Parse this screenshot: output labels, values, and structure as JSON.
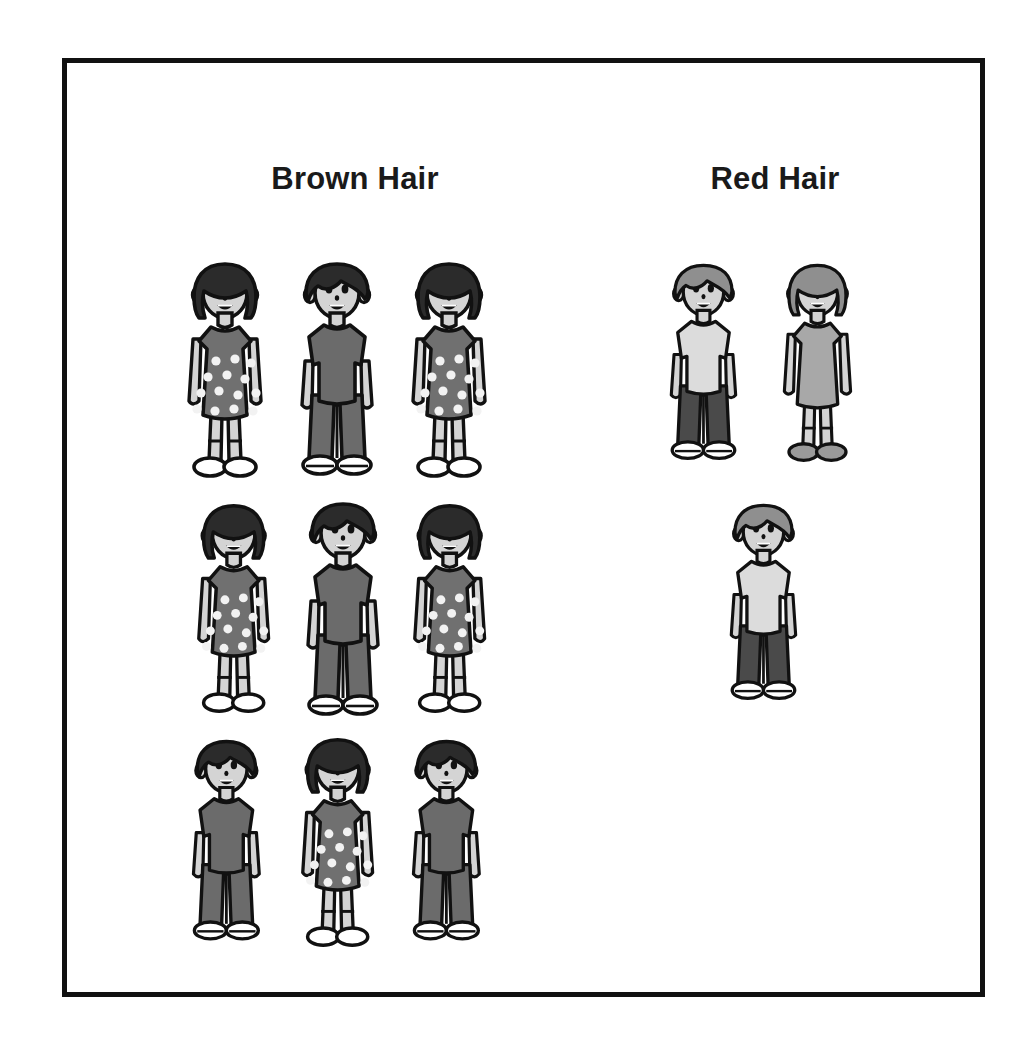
{
  "page": {
    "background": "#ffffff",
    "frame_border_color": "#111111"
  },
  "palette": {
    "outline": "#111111",
    "skin": "#d4d4d4",
    "hair_brown": "#2b2b2b",
    "hair_red": "#8f8f8f",
    "shirt_dark": "#6b6b6b",
    "shirt_light": "#dcdcdc",
    "dress_dark": "#707070",
    "dress_light": "#a8a8a8",
    "pants_dark": "#4a4a4a",
    "shoe_white": "#ffffff",
    "shoe_gray": "#9a9a9a",
    "dot_white": "#f2f2f2"
  },
  "columns": [
    {
      "id": "brown",
      "title": "Brown Hair",
      "count": 9
    },
    {
      "id": "red",
      "title": "Red Hair",
      "count": 3
    }
  ],
  "chart_data": {
    "type": "bar",
    "title": "",
    "subtitle": "",
    "xlabel": "",
    "ylabel": "",
    "categories": [
      "Brown Hair",
      "Red Hair"
    ],
    "values": [
      9,
      3
    ],
    "ylim": [
      0,
      9
    ],
    "grid": false,
    "legend": "none",
    "series": [
      {
        "name": "Brown Hair",
        "value": 9,
        "girls": 5,
        "boys": 4
      },
      {
        "name": "Red Hair",
        "value": 3,
        "girls": 1,
        "boys": 2
      }
    ]
  },
  "figures": [
    {
      "id": "brown-r1-c1",
      "group": "brown",
      "kind": "girl",
      "hair": "brown",
      "x": 176,
      "y": 250,
      "scale": 1.0,
      "dots": true,
      "shoe": "white",
      "dress": "dark"
    },
    {
      "id": "brown-r1-c2",
      "group": "brown",
      "kind": "boy",
      "hair": "brown",
      "x": 288,
      "y": 250,
      "scale": 1.0,
      "dots": false,
      "shoe": "white",
      "shirt": "dark"
    },
    {
      "id": "brown-r1-c3",
      "group": "brown",
      "kind": "girl",
      "hair": "brown",
      "x": 400,
      "y": 250,
      "scale": 1.0,
      "dots": true,
      "shoe": "white",
      "dress": "dark"
    },
    {
      "id": "brown-r2-c1",
      "group": "brown",
      "kind": "girl",
      "hair": "brown",
      "x": 186,
      "y": 492,
      "scale": 0.97,
      "dots": true,
      "shoe": "white",
      "dress": "dark"
    },
    {
      "id": "brown-r2-c2",
      "group": "brown",
      "kind": "boy",
      "hair": "brown",
      "x": 294,
      "y": 490,
      "scale": 1.0,
      "dots": false,
      "shoe": "white",
      "shirt": "dark"
    },
    {
      "id": "brown-r2-c3",
      "group": "brown",
      "kind": "girl",
      "hair": "brown",
      "x": 402,
      "y": 492,
      "scale": 0.97,
      "dots": true,
      "shoe": "white",
      "dress": "dark"
    },
    {
      "id": "brown-r3-c1",
      "group": "brown",
      "kind": "boy",
      "hair": "brown",
      "x": 180,
      "y": 728,
      "scale": 0.94,
      "dots": false,
      "shoe": "white",
      "shirt": "dark"
    },
    {
      "id": "brown-r3-c2",
      "group": "brown",
      "kind": "girl",
      "hair": "brown",
      "x": 290,
      "y": 726,
      "scale": 0.97,
      "dots": true,
      "shoe": "white",
      "dress": "dark"
    },
    {
      "id": "brown-r3-c3",
      "group": "brown",
      "kind": "boy",
      "hair": "brown",
      "x": 400,
      "y": 728,
      "scale": 0.94,
      "dots": false,
      "shoe": "white",
      "shirt": "dark"
    },
    {
      "id": "red-r1-c1",
      "group": "red",
      "kind": "boy",
      "hair": "red",
      "x": 658,
      "y": 252,
      "scale": 0.92,
      "dots": false,
      "shoe": "white",
      "shirt": "light"
    },
    {
      "id": "red-r1-c2",
      "group": "red",
      "kind": "girl",
      "hair": "red",
      "x": 772,
      "y": 252,
      "scale": 0.92,
      "dots": false,
      "shoe": "gray",
      "dress": "light"
    },
    {
      "id": "red-r2-c1",
      "group": "red",
      "kind": "boy",
      "hair": "red",
      "x": 718,
      "y": 492,
      "scale": 0.92,
      "dots": false,
      "shoe": "white",
      "shirt": "light"
    }
  ]
}
